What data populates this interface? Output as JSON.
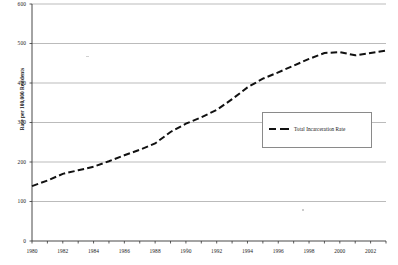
{
  "chart_data": {
    "type": "line",
    "title": "",
    "xlabel": "",
    "ylabel": "Rate per 100,000 Residents",
    "ylim": [
      0,
      600
    ],
    "xlim": [
      1980,
      2003
    ],
    "grid": true,
    "legend_position": "center-right",
    "y_ticks": [
      0,
      100,
      200,
      300,
      400,
      500,
      600
    ],
    "y_tick_labels": [
      "0",
      "100",
      "200",
      "300",
      "400",
      "500",
      "600"
    ],
    "x_ticks": [
      1980,
      1981,
      1982,
      1983,
      1984,
      1985,
      1986,
      1987,
      1988,
      1989,
      1990,
      1991,
      1992,
      1993,
      1994,
      1995,
      1996,
      1997,
      1998,
      1999,
      2000,
      2001,
      2002,
      2003
    ],
    "x_tick_labels_shown": [
      "1980",
      "1982",
      "1984",
      "1986",
      "1988",
      "1990",
      "1992",
      "1994",
      "1996",
      "1998",
      "2000",
      "2002"
    ],
    "series": [
      {
        "name": "Total Incarceration Rate",
        "color": "#111111",
        "style": "dashed",
        "x": [
          1980,
          1981,
          1982,
          1983,
          1984,
          1985,
          1986,
          1987,
          1988,
          1989,
          1990,
          1991,
          1992,
          1993,
          1994,
          1995,
          1996,
          1997,
          1998,
          1999,
          2000,
          2001,
          2002,
          2003
        ],
        "values": [
          139,
          153,
          170,
          179,
          188,
          202,
          217,
          231,
          247,
          276,
          297,
          313,
          332,
          359,
          389,
          411,
          427,
          444,
          461,
          476,
          478,
          470,
          476,
          482
        ]
      }
    ]
  },
  "legend": {
    "entries": [
      {
        "label": "Total Incarceration Rate"
      }
    ]
  },
  "axes": {
    "y_title": "Rate per 100,000 Residents",
    "y_labels": [
      "600",
      "500",
      "400",
      "300",
      "200",
      "100",
      "0"
    ],
    "x_labels": [
      "1980",
      "1982",
      "1984",
      "1986",
      "1988",
      "1990",
      "1992",
      "1994",
      "1996",
      "1998",
      "2000",
      "2002"
    ]
  }
}
